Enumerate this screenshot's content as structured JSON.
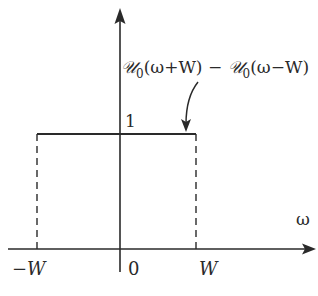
{
  "diagram": {
    "function_label": "𝒰₀(ω+W) − 𝒰₀(ω−W)",
    "function_label_parts": {
      "u1": "𝒰",
      "sub1": "0",
      "arg1": "(ω+W)",
      "minus": " − ",
      "u2": "𝒰",
      "sub2": "0",
      "arg2": "(ω−W)"
    },
    "height_label": "1",
    "x_axis_label": "ω",
    "tick_labels": {
      "left": "−W",
      "origin": "0",
      "right": "W"
    },
    "colors": {
      "line": "#2a2a2a",
      "background": "#ffffff"
    }
  }
}
